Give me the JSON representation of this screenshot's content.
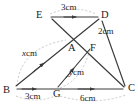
{
  "figure": {
    "type": "geometry-diagram",
    "background_color": "#ffffff",
    "stroke_color": "#3a3a3a",
    "arc_color": "#b0b0b0",
    "text_color": "#1d1d1d",
    "vertices": [
      {
        "id": "E",
        "label": "E",
        "x": 43,
        "y": 16
      },
      {
        "id": "D",
        "label": "D",
        "x": 103,
        "y": 16
      },
      {
        "id": "A",
        "label": "A",
        "x": 73,
        "y": 44
      },
      {
        "id": "F",
        "label": "F",
        "x": 93,
        "y": 44
      },
      {
        "id": "B",
        "label": "B",
        "x": 12,
        "y": 90
      },
      {
        "id": "G",
        "label": "G",
        "x": 57,
        "y": 90
      },
      {
        "id": "C",
        "label": "C",
        "x": 128,
        "y": 90
      }
    ],
    "segments": [
      {
        "id": "ED",
        "from": "E",
        "to": "D",
        "arrow": "mid-forward"
      },
      {
        "id": "BD",
        "from": "B",
        "to": "D",
        "arrow": "mid-forward"
      },
      {
        "id": "EC",
        "from": "E",
        "to": "C",
        "arrow": "none"
      },
      {
        "id": "BC",
        "from": "B",
        "to": "C",
        "arrow": "mid-forward"
      },
      {
        "id": "GF",
        "from": "G",
        "to": "F",
        "arrow": "mid-forward"
      },
      {
        "id": "DC",
        "from": "D",
        "to": "C",
        "arrow": "none"
      }
    ],
    "measurements": [
      {
        "id": "ED-length",
        "text": "3cm",
        "value": 3,
        "unit": "cm",
        "between": [
          "E",
          "D"
        ],
        "has_arc": true
      },
      {
        "id": "DA-length",
        "text": "2cm",
        "value": 2,
        "unit": "cm",
        "between": [
          "D",
          "A"
        ],
        "has_arc": false
      },
      {
        "id": "BA-length",
        "var": "x",
        "text": "cm",
        "full_text": "xcm",
        "between": [
          "B",
          "A"
        ],
        "has_arc": true
      },
      {
        "id": "GF-length",
        "var": "y",
        "text": "cm",
        "full_text": "ycm",
        "between": [
          "G",
          "F"
        ],
        "has_arc": true
      },
      {
        "id": "BG-length",
        "text": "3cm",
        "value": 3,
        "unit": "cm",
        "between": [
          "B",
          "G"
        ],
        "has_arc": true
      },
      {
        "id": "GC-length",
        "text": "6cm",
        "value": 6,
        "unit": "cm",
        "between": [
          "G",
          "C"
        ],
        "has_arc": true
      }
    ]
  },
  "labels": {
    "E": "E",
    "D": "D",
    "A": "A",
    "F": "F",
    "B": "B",
    "G": "G",
    "C": "C",
    "len_ED": "3cm",
    "len_DA": "2cm",
    "len_BA_var": "x",
    "len_BA_unit": "cm",
    "len_GF_var": "y",
    "len_GF_unit": "cm",
    "len_BG": "3cm",
    "len_GC": "6cm"
  }
}
